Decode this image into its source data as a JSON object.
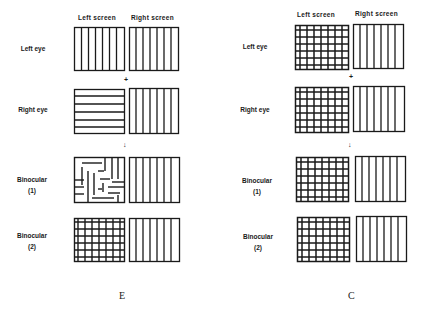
{
  "figures": [
    {
      "id": "E",
      "caption": "E",
      "column_headers": [
        "Left screen",
        "Right screen"
      ],
      "rows": [
        {
          "label": "Left eye",
          "sublabel": "",
          "left": "vertical",
          "right": "vertical"
        },
        {
          "label": "Right eye",
          "sublabel": "",
          "left": "horizontal",
          "right": "vertical"
        },
        {
          "label": "Binocular",
          "sublabel": "(1)",
          "left": "patchwork",
          "right": "vertical"
        },
        {
          "label": "Binocular",
          "sublabel": "(2)",
          "left": "grid",
          "right": "vertical"
        }
      ],
      "plus_symbol": "+",
      "arrow_symbol": "↓"
    },
    {
      "id": "C",
      "caption": "C",
      "column_headers": [
        "Left screen",
        "Right screen"
      ],
      "rows": [
        {
          "label": "Left eye",
          "sublabel": "",
          "left": "grid",
          "right": "vertical"
        },
        {
          "label": "Right eye",
          "sublabel": "",
          "left": "grid",
          "right": "vertical"
        },
        {
          "label": "Binocular",
          "sublabel": "(1)",
          "left": "grid",
          "right": "vertical"
        },
        {
          "label": "Binocular",
          "sublabel": "(2)",
          "left": "grid",
          "right": "vertical"
        }
      ],
      "plus_symbol": "+",
      "arrow_symbol": "↓"
    }
  ],
  "colors": {
    "ink": "#1a1a1a",
    "background": "#ffffff"
  }
}
